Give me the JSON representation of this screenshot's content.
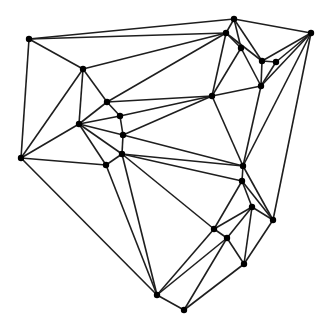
{
  "diagram": {
    "type": "planar-graph",
    "style": {
      "edge_color": "#1e1e1e",
      "node_color": "#000000",
      "background": "#ffffff",
      "node_radius": 3.2
    },
    "nodes": [
      {
        "id": 0,
        "x": 29,
        "y": 39
      },
      {
        "id": 1,
        "x": 234,
        "y": 19
      },
      {
        "id": 2,
        "x": 226,
        "y": 33
      },
      {
        "id": 3,
        "x": 311,
        "y": 33
      },
      {
        "id": 4,
        "x": 241,
        "y": 48
      },
      {
        "id": 5,
        "x": 262,
        "y": 61
      },
      {
        "id": 6,
        "x": 276,
        "y": 62
      },
      {
        "id": 7,
        "x": 261,
        "y": 86
      },
      {
        "id": 8,
        "x": 212,
        "y": 96
      },
      {
        "id": 9,
        "x": 83,
        "y": 69
      },
      {
        "id": 10,
        "x": 107,
        "y": 102
      },
      {
        "id": 11,
        "x": 120,
        "y": 116
      },
      {
        "id": 12,
        "x": 79,
        "y": 124
      },
      {
        "id": 13,
        "x": 123,
        "y": 135
      },
      {
        "id": 14,
        "x": 122,
        "y": 154
      },
      {
        "id": 15,
        "x": 106,
        "y": 165
      },
      {
        "id": 16,
        "x": 21,
        "y": 158
      },
      {
        "id": 17,
        "x": 243,
        "y": 166
      },
      {
        "id": 18,
        "x": 242,
        "y": 181
      },
      {
        "id": 19,
        "x": 252,
        "y": 207
      },
      {
        "id": 20,
        "x": 273,
        "y": 220
      },
      {
        "id": 21,
        "x": 214,
        "y": 229
      },
      {
        "id": 22,
        "x": 227,
        "y": 238
      },
      {
        "id": 23,
        "x": 244,
        "y": 264
      },
      {
        "id": 24,
        "x": 157,
        "y": 295
      },
      {
        "id": 25,
        "x": 184,
        "y": 310
      }
    ],
    "edges": [
      [
        0,
        1
      ],
      [
        0,
        2
      ],
      [
        0,
        9
      ],
      [
        0,
        16
      ],
      [
        1,
        2
      ],
      [
        1,
        4
      ],
      [
        1,
        5
      ],
      [
        1,
        3
      ],
      [
        2,
        4
      ],
      [
        2,
        8
      ],
      [
        2,
        5
      ],
      [
        2,
        9
      ],
      [
        2,
        10
      ],
      [
        3,
        5
      ],
      [
        3,
        6
      ],
      [
        3,
        7
      ],
      [
        3,
        17
      ],
      [
        3,
        20
      ],
      [
        4,
        8
      ],
      [
        4,
        7
      ],
      [
        5,
        6
      ],
      [
        5,
        7
      ],
      [
        6,
        7
      ],
      [
        7,
        8
      ],
      [
        7,
        17
      ],
      [
        8,
        10
      ],
      [
        8,
        11
      ],
      [
        8,
        13
      ],
      [
        8,
        17
      ],
      [
        9,
        10
      ],
      [
        9,
        12
      ],
      [
        9,
        16
      ],
      [
        10,
        11
      ],
      [
        10,
        12
      ],
      [
        11,
        12
      ],
      [
        11,
        13
      ],
      [
        12,
        13
      ],
      [
        12,
        14
      ],
      [
        12,
        15
      ],
      [
        12,
        16
      ],
      [
        13,
        14
      ],
      [
        13,
        17
      ],
      [
        14,
        15
      ],
      [
        14,
        17
      ],
      [
        14,
        18
      ],
      [
        14,
        21
      ],
      [
        14,
        24
      ],
      [
        15,
        16
      ],
      [
        15,
        24
      ],
      [
        16,
        24
      ],
      [
        17,
        18
      ],
      [
        17,
        20
      ],
      [
        18,
        20
      ],
      [
        18,
        19
      ],
      [
        18,
        21
      ],
      [
        19,
        20
      ],
      [
        19,
        21
      ],
      [
        19,
        22
      ],
      [
        19,
        23
      ],
      [
        20,
        23
      ],
      [
        21,
        22
      ],
      [
        21,
        24
      ],
      [
        22,
        23
      ],
      [
        22,
        24
      ],
      [
        22,
        25
      ],
      [
        23,
        25
      ],
      [
        24,
        25
      ]
    ]
  }
}
